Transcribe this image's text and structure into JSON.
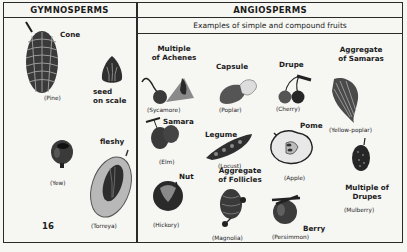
{
  "page_number": "16",
  "gymnosperms": {
    "header": "GYMNOSPERMS",
    "items": [
      {
        "label": "Cone",
        "caption": "(Pine)"
      },
      {
        "label": "seed on scale",
        "label_lines": [
          "seed",
          "on scale"
        ],
        "caption": ""
      },
      {
        "label": "",
        "caption": "(Yew)"
      },
      {
        "label": "fleshy",
        "caption": "(Torreya)"
      }
    ]
  },
  "angiosperms": {
    "header": "ANGIOSPERMS",
    "subheader": "Examples of simple and compound fruits",
    "items": [
      {
        "label_lines": [
          "Multiple",
          "of Achenes"
        ],
        "caption": "(Sycamore)"
      },
      {
        "label_lines": [
          "Capsule"
        ],
        "caption": "(Poplar)"
      },
      {
        "label_lines": [
          "Drupe"
        ],
        "caption": "(Cherry)"
      },
      {
        "label_lines": [
          "Aggregate",
          "of Samaras"
        ],
        "caption": "(Yellow-poplar)"
      },
      {
        "label_lines": [
          "Samara"
        ],
        "caption": "(Elm)"
      },
      {
        "label_lines": [
          "Legume"
        ],
        "caption": "(Locust)"
      },
      {
        "label_lines": [
          "Pome"
        ],
        "caption": "(Apple)"
      },
      {
        "label_lines": [
          "Multiple of",
          "Drupes"
        ],
        "caption": "(Mulberry)"
      },
      {
        "label_lines": [
          "Nut"
        ],
        "caption": "(Hickory)"
      },
      {
        "label_lines": [
          "Aggregate",
          "of Follicles"
        ],
        "caption": "(Magnolia)"
      },
      {
        "label_lines": [
          "Berry"
        ],
        "caption": "(Persimmon)"
      }
    ]
  },
  "colors": {
    "ink": "#1c1c1c",
    "paper": "#f6f6f3",
    "fruit_dark": "#2b2b2b",
    "fruit_mid": "#6a6a6a",
    "fruit_light": "#bdbdbd"
  }
}
